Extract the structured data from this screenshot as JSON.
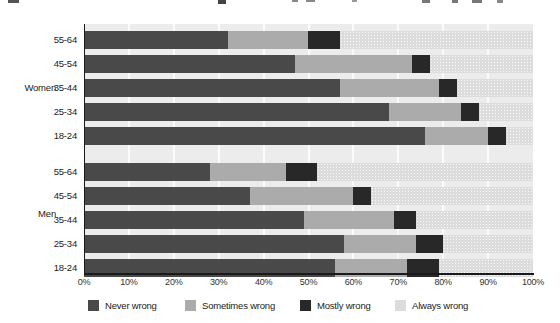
{
  "chart_data": {
    "type": "bar",
    "orientation": "horizontal",
    "stacked": true,
    "unit": "%",
    "x_axis": {
      "min": 0,
      "max": 100,
      "ticks": [
        "0%",
        "10%",
        "20%",
        "30%",
        "40%",
        "50%",
        "60%",
        "70%",
        "80%",
        "90%",
        "100%"
      ]
    },
    "legend": {
      "position": "bottom",
      "entries": [
        {
          "label": "Never wrong",
          "color": "#494949"
        },
        {
          "label": "Sometimes wrong",
          "color": "#ababab"
        },
        {
          "label": "Mostly wrong",
          "color": "#282828"
        },
        {
          "label": "Always wrong",
          "color": "#dcdcdc"
        }
      ]
    },
    "groups": [
      {
        "label": "Women",
        "rows": [
          {
            "label": "55-64",
            "values": [
              32,
              18,
              7,
              43
            ]
          },
          {
            "label": "45-54",
            "values": [
              47,
              26,
              4,
              23
            ]
          },
          {
            "label": "35-44",
            "values": [
              57,
              22,
              4,
              17
            ]
          },
          {
            "label": "25-34",
            "values": [
              68,
              16,
              4,
              12
            ]
          },
          {
            "label": "18-24",
            "values": [
              76,
              14,
              4,
              6
            ]
          }
        ]
      },
      {
        "label": "Men",
        "rows": [
          {
            "label": "55-64",
            "values": [
              28,
              17,
              7,
              48
            ]
          },
          {
            "label": "45-54",
            "values": [
              37,
              23,
              4,
              36
            ]
          },
          {
            "label": "35-44",
            "values": [
              49,
              20,
              5,
              26
            ]
          },
          {
            "label": "25-34",
            "values": [
              58,
              16,
              6,
              20
            ]
          },
          {
            "label": "18-24",
            "values": [
              56,
              16,
              7,
              21
            ]
          }
        ]
      }
    ],
    "plot_style": {
      "background": "#ececec",
      "gridline_color": "#ffffff",
      "axis_color": "#1a1a1a"
    }
  }
}
